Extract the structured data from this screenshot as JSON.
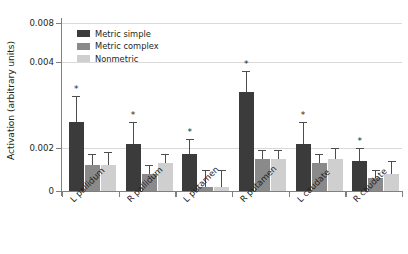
{
  "chart_data": {
    "type": "bar",
    "title": "",
    "xlabel": "",
    "ylabel": "Activation (arbitrary units)",
    "categories": [
      "L pallidum",
      "R pallidum",
      "L putamen",
      "R putamen",
      "L caudate",
      "R caudate"
    ],
    "series": [
      {
        "name": "Metric simple",
        "color": "#3b3b3b",
        "values": [
          0.0026,
          0.0021,
          0.0017,
          0.0033,
          0.0021,
          0.0014
        ],
        "errors": [
          0.0006,
          0.0005,
          0.0005,
          0.0005,
          0.0005,
          0.0006
        ]
      },
      {
        "name": "Metric complex",
        "color": "#8a8a8a",
        "values": [
          0.0012,
          0.0008,
          0.0002,
          0.0015,
          0.0013,
          0.0006
        ],
        "errors": [
          0.0005,
          0.0004,
          0.0008,
          0.0004,
          0.0004,
          0.0004
        ]
      },
      {
        "name": "Nonmetric",
        "color": "#cfcfcf",
        "values": [
          0.0012,
          0.0013,
          0.0002,
          0.0015,
          0.0015,
          0.0008
        ],
        "errors": [
          0.0006,
          0.0004,
          0.0008,
          0.0004,
          0.0005,
          0.0006
        ]
      }
    ],
    "annotations": [
      {
        "category": "L pallidum",
        "series": "Metric simple",
        "text": "*"
      },
      {
        "category": "R pallidum",
        "series": "Metric simple",
        "text": "*"
      },
      {
        "category": "L putamen",
        "series": "Metric simple",
        "text": "*"
      },
      {
        "category": "R putamen",
        "series": "Metric simple",
        "text": "*"
      },
      {
        "category": "L caudate",
        "series": "Metric simple",
        "text": "*"
      },
      {
        "category": "R caudate",
        "series": "Metric simple",
        "text": "*"
      }
    ],
    "yticks": [
      {
        "value": 0,
        "label": "0"
      },
      {
        "value": 0.002,
        "label": "0.002"
      },
      {
        "value": 0.004,
        "label": "0.004"
      },
      {
        "value": 0.008,
        "label": "0.008"
      }
    ],
    "ylim": [
      0,
      0.008
    ],
    "grid": true,
    "legend_position": "top-left"
  }
}
